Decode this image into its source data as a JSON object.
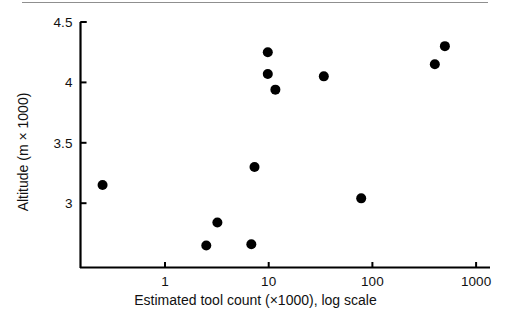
{
  "chart_data": {
    "type": "scatter",
    "title": "",
    "xlabel": "Estimated tool count (×1000), log scale",
    "ylabel": "Altitude (m × 1000)",
    "x_scale": "log",
    "y_scale": "linear",
    "xlim": [
      0.2,
      1300
    ],
    "ylim": [
      2.62,
      4.5
    ],
    "grid": false,
    "legend": null,
    "xticks": [
      {
        "value": 1,
        "label": "1"
      },
      {
        "value": 10,
        "label": "10"
      },
      {
        "value": 100,
        "label": "100"
      },
      {
        "value": 1000,
        "label": "1000"
      }
    ],
    "yticks": [
      {
        "value": 3,
        "label": "3"
      },
      {
        "value": 3.5,
        "label": "3.5"
      },
      {
        "value": 4,
        "label": "4"
      },
      {
        "value": 4.5,
        "label": "4.5"
      }
    ],
    "marker": {
      "shape": "circle",
      "color": "#000000",
      "size": 5
    },
    "points": [
      {
        "x": 0.25,
        "y": 3.15
      },
      {
        "x": 2.5,
        "y": 2.65
      },
      {
        "x": 3.2,
        "y": 2.84
      },
      {
        "x": 6.8,
        "y": 2.66
      },
      {
        "x": 7.3,
        "y": 3.3
      },
      {
        "x": 9.8,
        "y": 4.25
      },
      {
        "x": 9.8,
        "y": 4.07
      },
      {
        "x": 11.6,
        "y": 3.94
      },
      {
        "x": 34,
        "y": 4.05
      },
      {
        "x": 78,
        "y": 3.04
      },
      {
        "x": 400,
        "y": 4.15
      },
      {
        "x": 500,
        "y": 4.3
      }
    ]
  },
  "figure": {
    "top_rule_visible": true,
    "background_color": "#ffffff",
    "axis_color": "#000000"
  }
}
